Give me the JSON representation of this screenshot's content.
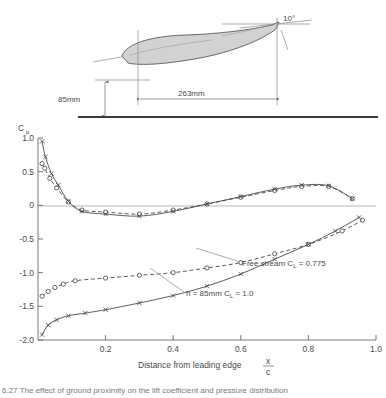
{
  "figure": {
    "caption_number": "6.27",
    "caption_text": "The effect of ground proximity on the lift coefficient and pressure distribution"
  },
  "diagram": {
    "height_label": "85mm",
    "chord_label": "263mm",
    "angle_label": "10°",
    "airfoil_fill": "#d2d2d2",
    "airfoil_stroke": "#5a5a5a",
    "ground_color": "#3a3a3a"
  },
  "chart_data": {
    "type": "line",
    "title": "",
    "xlabel": "Distance from leading edge",
    "xlabel_frac_num": "x",
    "xlabel_frac_den": "c",
    "ylabel": "C",
    "ylabel_sub": "p",
    "xlim": [
      0.0,
      1.0
    ],
    "ylim": [
      -2.0,
      1.0
    ],
    "yticks": [
      "1.0",
      "0.5",
      "0",
      "-0.5",
      "-1.0",
      "-1.5",
      "-2.0"
    ],
    "ytick_values": [
      1.0,
      0.5,
      0.0,
      -0.5,
      -1.0,
      -1.5,
      -2.0
    ],
    "xticks": [
      "0.2",
      "0.4",
      "0.6",
      "0.8",
      "1.0"
    ],
    "xtick_values": [
      0.2,
      0.4,
      0.6,
      0.8,
      1.0
    ],
    "grid": false,
    "zero_line": true,
    "annotations": [
      {
        "id": "free-stream",
        "text": "Free stream C",
        "sub": "L",
        "tail": " = 0.775"
      },
      {
        "id": "ground-effect",
        "text": "h = 85mm  C",
        "sub": "L",
        "tail": " = 1.0"
      }
    ],
    "series": [
      {
        "name": "Free stream CL = 0.775 - pressure surface",
        "marker": "circle",
        "style": "dashed",
        "x": [
          0.012,
          0.02,
          0.035,
          0.055,
          0.09,
          0.13,
          0.2,
          0.3,
          0.4,
          0.5,
          0.6,
          0.7,
          0.78,
          0.86,
          0.93
        ],
        "y": [
          0.62,
          0.55,
          0.4,
          0.26,
          0.05,
          -0.07,
          -0.1,
          -0.13,
          -0.07,
          0.02,
          0.12,
          0.22,
          0.28,
          0.28,
          0.1
        ]
      },
      {
        "name": "h = 85mm CL = 1.0 - pressure surface",
        "marker": "cross",
        "style": "solid",
        "x": [
          0.012,
          0.022,
          0.04,
          0.06,
          0.09,
          0.13,
          0.2,
          0.3,
          0.4,
          0.5,
          0.6,
          0.7,
          0.78,
          0.86,
          0.93
        ],
        "y": [
          0.95,
          0.72,
          0.47,
          0.3,
          0.06,
          -0.09,
          -0.13,
          -0.16,
          -0.09,
          0.02,
          0.13,
          0.24,
          0.3,
          0.29,
          0.1
        ]
      },
      {
        "name": "Free stream CL = 0.775 - suction surface",
        "marker": "circle",
        "style": "dashed",
        "x": [
          0.012,
          0.03,
          0.05,
          0.075,
          0.11,
          0.2,
          0.3,
          0.4,
          0.5,
          0.6,
          0.7,
          0.8,
          0.9,
          0.96
        ],
        "y": [
          -1.35,
          -1.28,
          -1.22,
          -1.17,
          -1.12,
          -1.08,
          -1.04,
          -1.0,
          -0.93,
          -0.85,
          -0.72,
          -0.58,
          -0.38,
          -0.22
        ]
      },
      {
        "name": "h = 85mm CL = 1.0 - suction surface",
        "marker": "cross",
        "style": "solid",
        "x": [
          0.012,
          0.03,
          0.055,
          0.09,
          0.14,
          0.2,
          0.3,
          0.4,
          0.5,
          0.6,
          0.7,
          0.8,
          0.88,
          0.95
        ],
        "y": [
          -1.92,
          -1.78,
          -1.7,
          -1.64,
          -1.6,
          -1.55,
          -1.45,
          -1.34,
          -1.2,
          -1.02,
          -0.8,
          -0.58,
          -0.38,
          -0.18
        ]
      }
    ]
  }
}
